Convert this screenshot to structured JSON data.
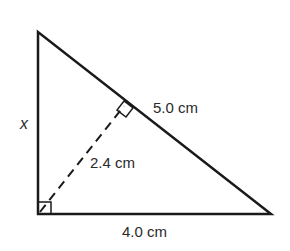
{
  "diagram": {
    "type": "right-triangle-with-altitude",
    "labels": {
      "left_side": "x",
      "hypotenuse": "5.0 cm",
      "altitude": "2.4 cm",
      "base": "4.0 cm"
    },
    "vertices": {
      "top": [
        38,
        32
      ],
      "bottom_left": [
        38,
        214
      ],
      "bottom_right": [
        271,
        214
      ],
      "altitude_foot": [
        126,
        104
      ]
    },
    "colors": {
      "stroke": "#1a1a1a",
      "text": "#2a2a2a",
      "background": "#ffffff"
    }
  }
}
